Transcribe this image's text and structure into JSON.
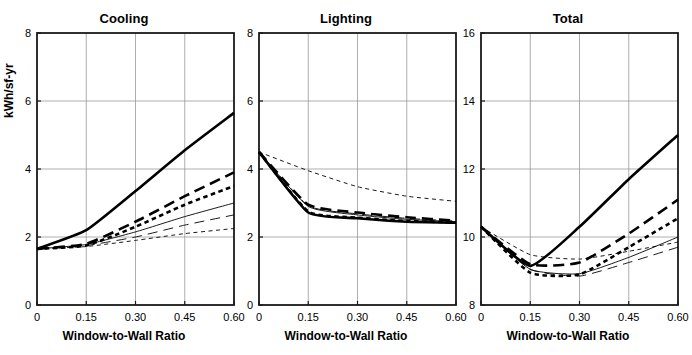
{
  "figure": {
    "width": 692,
    "height": 355,
    "background": "#ffffff",
    "ylabel": "kWh/sf-yr",
    "xlabel": "Window-to-Wall Ratio"
  },
  "chart_data": [
    {
      "type": "line",
      "title": "Cooling",
      "xlabel": "Window-to-Wall Ratio",
      "ylabel": "kWh/sf-yr",
      "x": [
        0,
        0.15,
        0.3,
        0.45,
        0.6
      ],
      "xticks": [
        "0",
        "0.15",
        "0.30",
        "0.45",
        "0.60"
      ],
      "xlim": [
        0,
        0.6
      ],
      "ylim": [
        0,
        8
      ],
      "yticks": [
        "0",
        "2",
        "4",
        "6",
        "8"
      ],
      "ytickvals": [
        0,
        2,
        4,
        6,
        8
      ],
      "grid": true,
      "legend": "none",
      "series": [
        {
          "name": "series-1",
          "style": "thick-solid",
          "values": [
            1.65,
            2.2,
            3.35,
            4.55,
            5.65
          ]
        },
        {
          "name": "series-2",
          "style": "thick-long-dash",
          "values": [
            1.65,
            1.8,
            2.45,
            3.2,
            3.9
          ]
        },
        {
          "name": "series-3",
          "style": "thick-short-dash",
          "values": [
            1.65,
            1.75,
            2.3,
            2.95,
            3.5
          ]
        },
        {
          "name": "series-4",
          "style": "thin-solid",
          "values": [
            1.65,
            1.78,
            2.15,
            2.6,
            3.0
          ]
        },
        {
          "name": "series-5",
          "style": "thin-long-dash",
          "values": [
            1.65,
            1.75,
            2.0,
            2.35,
            2.65
          ]
        },
        {
          "name": "series-6",
          "style": "thin-short-dash",
          "values": [
            1.65,
            1.72,
            1.9,
            2.1,
            2.25
          ]
        }
      ]
    },
    {
      "type": "line",
      "title": "Lighting",
      "xlabel": "Window-to-Wall Ratio",
      "ylabel": "kWh/sf-yr",
      "x": [
        0,
        0.15,
        0.3,
        0.45,
        0.6
      ],
      "xticks": [
        "0",
        "0.15",
        "0.30",
        "0.45",
        "0.60"
      ],
      "xlim": [
        0,
        0.6
      ],
      "ylim": [
        0,
        8
      ],
      "yticks": [
        "0",
        "2",
        "4",
        "6",
        "8"
      ],
      "ytickvals": [
        0,
        2,
        4,
        6,
        8
      ],
      "grid": true,
      "legend": "none",
      "series": [
        {
          "name": "series-1",
          "style": "thick-solid",
          "values": [
            4.5,
            2.72,
            2.55,
            2.45,
            2.42
          ]
        },
        {
          "name": "series-2",
          "style": "thick-long-dash",
          "values": [
            4.5,
            2.95,
            2.72,
            2.58,
            2.48
          ]
        },
        {
          "name": "series-3",
          "style": "thick-short-dash",
          "values": [
            4.5,
            2.75,
            2.57,
            2.47,
            2.43
          ]
        },
        {
          "name": "series-4",
          "style": "thin-solid",
          "values": [
            4.5,
            2.9,
            2.65,
            2.52,
            2.45
          ]
        },
        {
          "name": "series-5",
          "style": "thin-long-dash",
          "values": [
            4.5,
            2.92,
            2.68,
            2.55,
            2.47
          ]
        },
        {
          "name": "series-6",
          "style": "thin-short-dash",
          "values": [
            4.5,
            3.95,
            3.48,
            3.2,
            3.05
          ]
        }
      ]
    },
    {
      "type": "line",
      "title": "Total",
      "xlabel": "Window-to-Wall Ratio",
      "ylabel": "kWh/sf-yr",
      "x": [
        0,
        0.15,
        0.3,
        0.45,
        0.6
      ],
      "xticks": [
        "0",
        "0.15",
        "0.30",
        "0.45",
        "0.60"
      ],
      "xlim": [
        0,
        0.6
      ],
      "ylim": [
        8,
        16
      ],
      "yticks": [
        "8",
        "10",
        "12",
        "14",
        "16"
      ],
      "ytickvals": [
        8,
        10,
        12,
        14,
        16
      ],
      "grid": true,
      "legend": "none",
      "series": [
        {
          "name": "series-1",
          "style": "thick-solid",
          "values": [
            10.3,
            9.15,
            10.3,
            11.7,
            13.0
          ]
        },
        {
          "name": "series-2",
          "style": "thick-long-dash",
          "values": [
            10.3,
            9.2,
            9.25,
            10.1,
            11.1
          ]
        },
        {
          "name": "series-3",
          "style": "thick-short-dash",
          "values": [
            10.3,
            8.95,
            8.9,
            9.7,
            10.55
          ]
        },
        {
          "name": "series-4",
          "style": "thin-solid",
          "values": [
            10.3,
            9.05,
            8.92,
            9.4,
            10.0
          ]
        },
        {
          "name": "series-5",
          "style": "thin-long-dash",
          "values": [
            10.3,
            9.05,
            8.85,
            9.25,
            9.7
          ]
        },
        {
          "name": "series-6",
          "style": "thin-short-dash",
          "values": [
            10.3,
            9.48,
            9.35,
            9.58,
            9.85
          ]
        }
      ]
    }
  ],
  "panels": [
    {
      "title": "Cooling",
      "left": 0,
      "width": 248,
      "plot": {
        "x0": 37,
        "y0": 33,
        "x1": 234,
        "y1": 305
      }
    },
    {
      "title": "Lighting",
      "left": 222,
      "width": 248,
      "plot": {
        "x0": 37,
        "y0": 33,
        "x1": 234,
        "y1": 305
      }
    },
    {
      "title": "Total",
      "left": 444,
      "width": 248,
      "plot": {
        "x0": 37,
        "y0": 33,
        "x1": 234,
        "y1": 305
      }
    }
  ],
  "style": {
    "axis_color": "#1a1a1a",
    "grid_color": "#999999",
    "line_color": "#000000",
    "thick_width": 2.6,
    "thin_width": 0.9
  }
}
